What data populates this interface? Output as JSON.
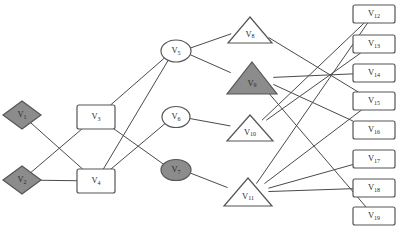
{
  "diagram": {
    "background": "#ffffff",
    "edge_color": "#4a4a4a",
    "stroke_color": "#555555",
    "fill_white": "#ffffff",
    "fill_gray": "#8c8c8c",
    "nodes": [
      {
        "id": "v1",
        "label": "V",
        "sub": "1",
        "shape": "diamond",
        "fill": "#8c8c8c",
        "x": 22,
        "y": 115,
        "w": 38,
        "h": 28
      },
      {
        "id": "v2",
        "label": "V",
        "sub": "2",
        "shape": "diamond",
        "fill": "#8c8c8c",
        "x": 22,
        "y": 180,
        "w": 38,
        "h": 28
      },
      {
        "id": "v3",
        "label": "V",
        "sub": "3",
        "shape": "rectangle",
        "fill": "#ffffff",
        "x": 96,
        "y": 117,
        "w": 38,
        "h": 24
      },
      {
        "id": "v4",
        "label": "V",
        "sub": "4",
        "shape": "rectangle",
        "fill": "#ffffff",
        "x": 96,
        "y": 181,
        "w": 38,
        "h": 24
      },
      {
        "id": "v5",
        "label": "V",
        "sub": "5",
        "shape": "ellipse",
        "fill": "#ffffff",
        "x": 176,
        "y": 51,
        "w": 30,
        "h": 22
      },
      {
        "id": "v6",
        "label": "V",
        "sub": "6",
        "shape": "ellipse",
        "fill": "#ffffff",
        "x": 176,
        "y": 117,
        "w": 28,
        "h": 21
      },
      {
        "id": "v7",
        "label": "V",
        "sub": "7",
        "shape": "ellipse",
        "fill": "#8c8c8c",
        "x": 176,
        "y": 170,
        "w": 30,
        "h": 21
      },
      {
        "id": "v8",
        "label": "V",
        "sub": "8",
        "shape": "triangle",
        "fill": "#ffffff",
        "x": 250,
        "y": 30,
        "w": 44,
        "h": 26
      },
      {
        "id": "v9",
        "label": "V",
        "sub": "9",
        "shape": "triangle",
        "fill": "#8c8c8c",
        "x": 252,
        "y": 78,
        "w": 50,
        "h": 32
      },
      {
        "id": "v10",
        "label": "V",
        "sub": "10",
        "shape": "triangle",
        "fill": "#ffffff",
        "x": 250,
        "y": 128,
        "w": 46,
        "h": 26
      },
      {
        "id": "v11",
        "label": "V",
        "sub": "11",
        "shape": "triangle",
        "fill": "#ffffff",
        "x": 248,
        "y": 192,
        "w": 48,
        "h": 28
      },
      {
        "id": "v12",
        "label": "V",
        "sub": "12",
        "shape": "rectangle",
        "fill": "#ffffff",
        "x": 374,
        "y": 14,
        "w": 42,
        "h": 18
      },
      {
        "id": "v13",
        "label": "V",
        "sub": "13",
        "shape": "rectangle",
        "fill": "#ffffff",
        "x": 374,
        "y": 44,
        "w": 42,
        "h": 18
      },
      {
        "id": "v14",
        "label": "V",
        "sub": "14",
        "shape": "rectangle",
        "fill": "#ffffff",
        "x": 374,
        "y": 73,
        "w": 42,
        "h": 18
      },
      {
        "id": "v15",
        "label": "V",
        "sub": "15",
        "shape": "rectangle",
        "fill": "#ffffff",
        "x": 374,
        "y": 101,
        "w": 42,
        "h": 18
      },
      {
        "id": "v16",
        "label": "V",
        "sub": "16",
        "shape": "rectangle",
        "fill": "#ffffff",
        "x": 374,
        "y": 130,
        "w": 42,
        "h": 18
      },
      {
        "id": "v17",
        "label": "V",
        "sub": "17",
        "shape": "rectangle",
        "fill": "#ffffff",
        "x": 374,
        "y": 159,
        "w": 42,
        "h": 18
      },
      {
        "id": "v18",
        "label": "V",
        "sub": "18",
        "shape": "rectangle",
        "fill": "#ffffff",
        "x": 374,
        "y": 188,
        "w": 42,
        "h": 18
      },
      {
        "id": "v19",
        "label": "V",
        "sub": "19",
        "shape": "rectangle",
        "fill": "#ffffff",
        "x": 374,
        "y": 216,
        "w": 42,
        "h": 18
      }
    ],
    "edges": [
      {
        "from": "v1",
        "to": "v4"
      },
      {
        "from": "v2",
        "to": "v3"
      },
      {
        "from": "v2",
        "to": "v4"
      },
      {
        "from": "v3",
        "to": "v5"
      },
      {
        "from": "v3",
        "to": "v7"
      },
      {
        "from": "v4",
        "to": "v5"
      },
      {
        "from": "v4",
        "to": "v6"
      },
      {
        "from": "v5",
        "to": "v8"
      },
      {
        "from": "v5",
        "to": "v9"
      },
      {
        "from": "v6",
        "to": "v10"
      },
      {
        "from": "v7",
        "to": "v11"
      },
      {
        "from": "v8",
        "to": "v15"
      },
      {
        "from": "v9",
        "to": "v14"
      },
      {
        "from": "v9",
        "to": "v16"
      },
      {
        "from": "v9",
        "to": "v19"
      },
      {
        "from": "v10",
        "to": "v12"
      },
      {
        "from": "v10",
        "to": "v13"
      },
      {
        "from": "v11",
        "to": "v12"
      },
      {
        "from": "v11",
        "to": "v15"
      },
      {
        "from": "v11",
        "to": "v17"
      },
      {
        "from": "v11",
        "to": "v18"
      }
    ]
  }
}
